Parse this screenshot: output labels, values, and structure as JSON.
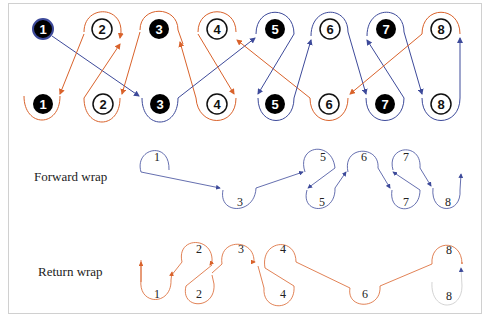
{
  "colors": {
    "forward": "#3d4a9a",
    "return": "#d9622b",
    "filled_node": "#000000",
    "open_node_fill": "#ffffff",
    "node_stroke": "#111111",
    "frame": "#d0d0d0"
  },
  "top_diagram": {
    "row1_nodes": [
      {
        "label": "1",
        "filled": true
      },
      {
        "label": "2",
        "filled": false
      },
      {
        "label": "3",
        "filled": true
      },
      {
        "label": "4",
        "filled": false
      },
      {
        "label": "5",
        "filled": true
      },
      {
        "label": "6",
        "filled": false
      },
      {
        "label": "7",
        "filled": true
      },
      {
        "label": "8",
        "filled": false
      }
    ],
    "row2_nodes": [
      {
        "label": "1",
        "filled": true
      },
      {
        "label": "2",
        "filled": false
      },
      {
        "label": "3",
        "filled": true
      },
      {
        "label": "4",
        "filled": false
      },
      {
        "label": "5",
        "filled": true
      },
      {
        "label": "6",
        "filled": false
      },
      {
        "label": "7",
        "filled": true
      },
      {
        "label": "8",
        "filled": false
      }
    ]
  },
  "forward_wrap": {
    "label": "Forward wrap",
    "top_labels": [
      "1",
      "5",
      "6",
      "7"
    ],
    "bottom_labels": [
      "3",
      "5",
      "7",
      "8"
    ]
  },
  "return_wrap": {
    "label": "Return wrap",
    "top_labels": [
      "2",
      "3",
      "4",
      "8"
    ],
    "bottom_labels": [
      "1",
      "2",
      "4",
      "6",
      "8"
    ]
  }
}
